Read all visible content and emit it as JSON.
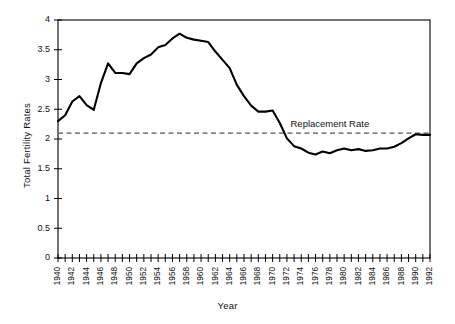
{
  "chart_data": {
    "type": "line",
    "title": "",
    "xlabel": "Year",
    "ylabel": "Total Fertility Rates",
    "xlim": [
      1940,
      1992
    ],
    "ylim": [
      0,
      4
    ],
    "ytick_values": [
      0,
      0.5,
      1,
      1.5,
      2,
      2.5,
      3,
      3.5,
      4
    ],
    "ytick_labels": [
      "0",
      "0.5",
      "1",
      "1.5",
      "2",
      "2.5",
      "3",
      "3.5",
      "4"
    ],
    "xtick_labels": [
      "1940",
      "1942",
      "1944",
      "1946",
      "1948",
      "1950",
      "1952",
      "1954",
      "1956",
      "1958",
      "1960",
      "1962",
      "1964",
      "1966",
      "1968",
      "1970",
      "1972",
      "1974",
      "1976",
      "1978",
      "1980",
      "1982",
      "1984",
      "1986",
      "1988",
      "1990",
      "1992"
    ],
    "xtick_label_step": 2,
    "xtick_minor_step": 1,
    "grid": false,
    "legend": "none",
    "series": [
      {
        "name": "Total Fertility Rate",
        "color": "#000000",
        "x": [
          1940,
          1941,
          1942,
          1943,
          1944,
          1945,
          1946,
          1947,
          1948,
          1949,
          1950,
          1951,
          1952,
          1953,
          1954,
          1955,
          1956,
          1957,
          1958,
          1959,
          1960,
          1961,
          1962,
          1963,
          1964,
          1965,
          1966,
          1967,
          1968,
          1969,
          1970,
          1971,
          1972,
          1973,
          1974,
          1975,
          1976,
          1977,
          1978,
          1979,
          1980,
          1981,
          1982,
          1983,
          1984,
          1985,
          1986,
          1987,
          1988,
          1989,
          1990,
          1991,
          1992
        ],
        "values": [
          2.3,
          2.4,
          2.63,
          2.72,
          2.57,
          2.49,
          2.94,
          3.27,
          3.11,
          3.11,
          3.09,
          3.27,
          3.36,
          3.42,
          3.54,
          3.58,
          3.69,
          3.77,
          3.7,
          3.67,
          3.65,
          3.63,
          3.47,
          3.33,
          3.19,
          2.91,
          2.72,
          2.56,
          2.46,
          2.46,
          2.48,
          2.27,
          2.01,
          1.88,
          1.84,
          1.77,
          1.74,
          1.79,
          1.76,
          1.81,
          1.84,
          1.81,
          1.83,
          1.8,
          1.81,
          1.84,
          1.84,
          1.87,
          1.93,
          2.01,
          2.08,
          2.07,
          2.07
        ]
      }
    ],
    "reference_lines": [
      {
        "name": "replacement-rate",
        "label": "Replacement Rate",
        "value": 2.1,
        "orientation": "horizontal",
        "style": "dashed",
        "color": "#555555",
        "label_x": 1978
      }
    ]
  }
}
